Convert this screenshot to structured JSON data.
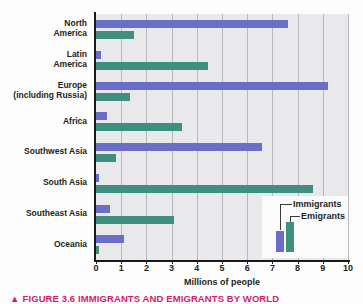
{
  "figure": {
    "caption_marker": "▲",
    "caption": "FIGURE 3.6  IMMIGRANTS AND EMIGRANTS BY WORLD"
  },
  "legend": {
    "immigrants_label": "Immigrants",
    "emigrants_label": "Emigrants"
  },
  "colors": {
    "immigrants": "#6b6ec9",
    "emigrants": "#3f8f80",
    "plot_background": "#e9e8ea",
    "gridline": "#b9b7bb",
    "axis": "#1a1a1a",
    "caption": "#d61c6a"
  },
  "chart_data": {
    "type": "bar",
    "orientation": "horizontal",
    "title": "",
    "subtitle": "",
    "xlabel": "Millions of people",
    "ylabel": "",
    "xlim": [
      0,
      10
    ],
    "xticks": [
      0,
      1,
      2,
      3,
      4,
      5,
      6,
      7,
      8,
      9,
      10
    ],
    "xtick_labels": [
      "0",
      "1",
      "2",
      "3",
      "4",
      "5",
      "6",
      "7",
      "8",
      "9",
      "10"
    ],
    "grid": "vertical",
    "legend_position": "inset-bottom-right",
    "categories": [
      "North America",
      "Latin America",
      "Europe (including Russia)",
      "Africa",
      "Southwest Asia",
      "South Asia",
      "Southeast Asia",
      "Oceania"
    ],
    "category_lines": [
      [
        "North",
        "America"
      ],
      [
        "Latin",
        "America"
      ],
      [
        "Europe",
        "(including Russia)"
      ],
      [
        "Africa"
      ],
      [
        "Southwest Asia"
      ],
      [
        "South Asia"
      ],
      [
        "Southeast Asia"
      ],
      [
        "Oceania"
      ]
    ],
    "series": [
      {
        "name": "Immigrants",
        "color": "#6b6ec9",
        "values": [
          7.6,
          0.2,
          9.2,
          0.45,
          6.6,
          0.1,
          0.55,
          1.1
        ]
      },
      {
        "name": "Emigrants",
        "color": "#3f8f80",
        "values": [
          1.5,
          4.45,
          1.35,
          3.4,
          0.8,
          8.6,
          3.1,
          0.1
        ]
      }
    ]
  }
}
